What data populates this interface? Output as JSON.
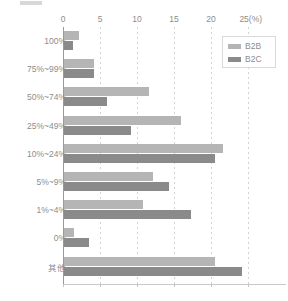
{
  "top_strip": {
    "label": ""
  },
  "legend": {
    "position": "top-right",
    "items": [
      {
        "label": "B2B",
        "color": "#b5b5b5"
      },
      {
        "label": "B2C",
        "color": "#8a8a8a"
      }
    ]
  },
  "axis": {
    "unit_suffix": "(%)",
    "ticks": [
      "0",
      "5",
      "10",
      "15",
      "20",
      "25"
    ],
    "tick_last_display": "25(%)"
  },
  "chart_data": {
    "type": "bar",
    "orientation": "horizontal",
    "title": "",
    "subtitle": "",
    "xlabel": "(%)",
    "ylabel": "",
    "xlim": [
      0,
      25
    ],
    "xticks": [
      0,
      5,
      10,
      15,
      20,
      25
    ],
    "grid": true,
    "grid_axis": "x",
    "legend_position": "top-right",
    "categories": [
      "100%",
      "75%~99%",
      "50%~74%",
      "25%~49%",
      "10%~24%",
      "5%~9%",
      "1%~4%",
      "0%",
      "其他"
    ],
    "series": [
      {
        "name": "B2B",
        "color": "#b5b5b5",
        "values": [
          2.0,
          4.0,
          11.5,
          15.8,
          21.5,
          12.0,
          10.7,
          1.4,
          20.4
        ]
      },
      {
        "name": "B2C",
        "color": "#8a8a8a",
        "values": [
          1.2,
          4.0,
          5.8,
          9.0,
          20.4,
          14.2,
          17.2,
          3.4,
          24.0
        ]
      }
    ]
  }
}
